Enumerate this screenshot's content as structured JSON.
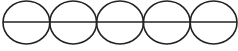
{
  "diagram": {
    "stroke_color": "#222222",
    "stroke_width": 1.6,
    "background": "#ffffff",
    "circles": [
      {
        "cx": 26.4,
        "cy": 22.5,
        "rx": 23.4,
        "ry": 21.5
      },
      {
        "cx": 73.2,
        "cy": 22.5,
        "rx": 23.4,
        "ry": 21.5
      },
      {
        "cx": 120.0,
        "cy": 22.5,
        "rx": 23.4,
        "ry": 21.5
      },
      {
        "cx": 166.8,
        "cy": 22.5,
        "rx": 23.4,
        "ry": 21.5
      },
      {
        "cx": 213.6,
        "cy": 22.5,
        "rx": 23.4,
        "ry": 21.5
      }
    ],
    "line": {
      "x1": 3,
      "y1": 22,
      "x2": 237,
      "y2": 22
    }
  }
}
